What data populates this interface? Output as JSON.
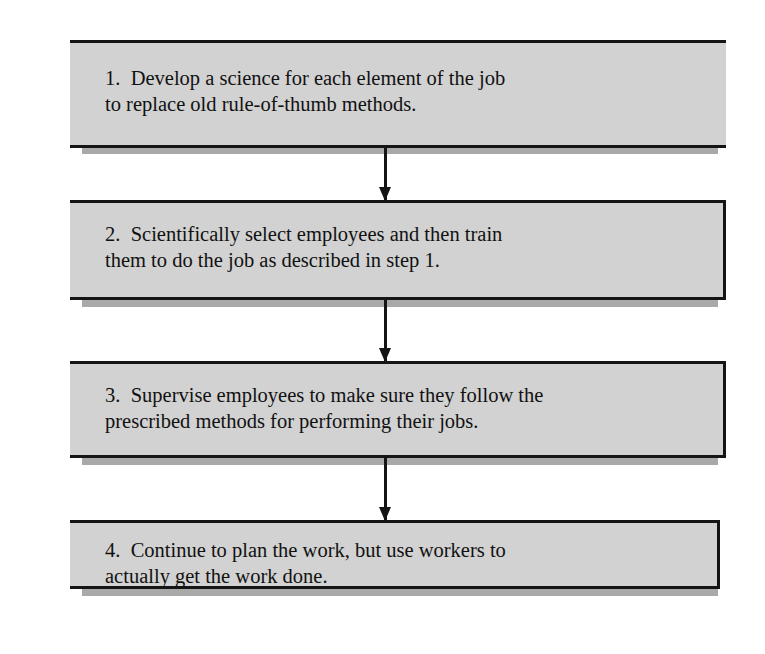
{
  "diagram": {
    "type": "vertical-flowchart",
    "steps": [
      {
        "number": "1.",
        "line1": "1.  Develop a science for each element of the job",
        "line2": "to replace old rule-of-thumb methods."
      },
      {
        "number": "2.",
        "line1": "2.  Scientifically select employees and then train",
        "line2": "them to do the job as described in step 1."
      },
      {
        "number": "3.",
        "line1": "3.  Supervise employees to make sure they follow the",
        "line2": "prescribed methods for performing their jobs."
      },
      {
        "number": "4.",
        "line1": "4.  Continue to plan the work, but use workers to",
        "line2": "actually get the work done."
      }
    ],
    "colors": {
      "box_fill": "#d2d2d2",
      "shadow": "#a9a9a9",
      "border": "#151515"
    }
  }
}
